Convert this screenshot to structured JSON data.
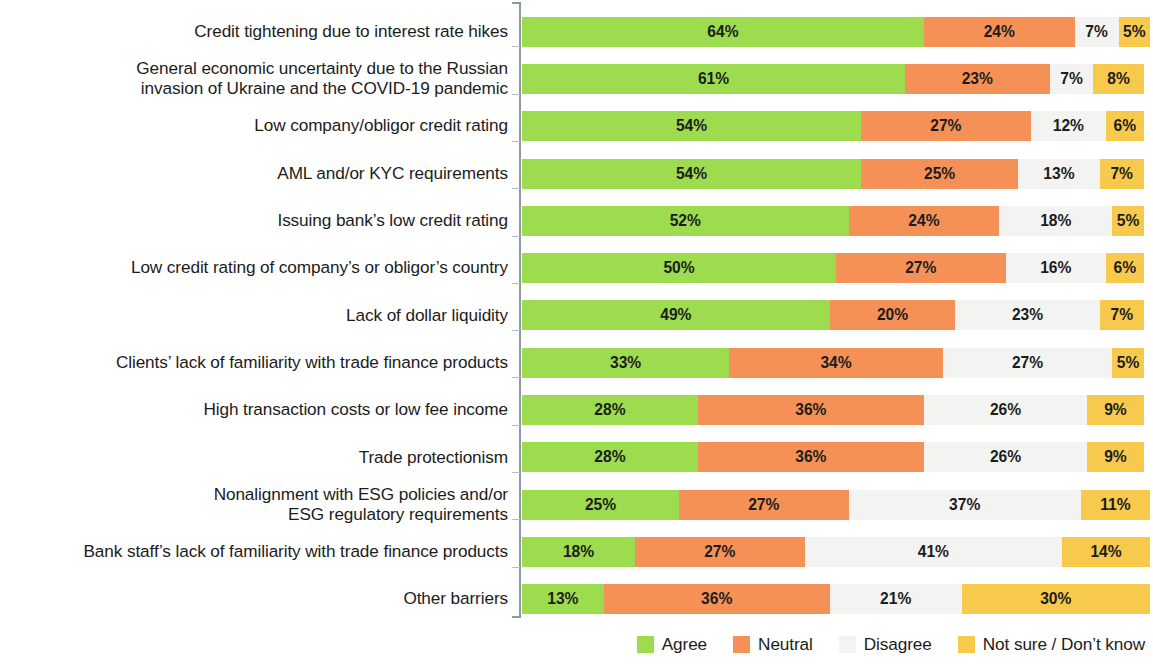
{
  "chart_data": {
    "type": "bar",
    "subtype": "stacked-horizontal-100percent",
    "title": "",
    "subtitle": "",
    "xlabel": "",
    "ylabel": "",
    "xlim": [
      0,
      100
    ],
    "grid": false,
    "legend_position": "bottom-right",
    "value_suffix": "%",
    "categories": [
      "Credit tightening due to interest rate hikes",
      "General economic uncertainty due to the Russian\ninvasion of Ukraine and the COVID-19 pandemic",
      "Low company/obligor credit rating",
      "AML and/or KYC requirements",
      "Issuing bank’s low credit rating",
      "Low credit rating of company’s or obligor’s country",
      "Lack of dollar liquidity",
      "Clients’ lack of familiarity with trade finance products",
      "High transaction costs or low fee income",
      "Trade protectionism",
      "Nonalignment with ESG policies and/or\nESG regulatory requirements",
      "Bank staff’s lack of familiarity with trade finance products",
      "Other barriers"
    ],
    "series": [
      {
        "name": "Agree",
        "color": "#9cdc4e",
        "values": [
          64,
          61,
          54,
          54,
          52,
          50,
          49,
          33,
          28,
          28,
          25,
          18,
          13
        ],
        "labels": [
          "64%",
          "61%",
          "54%",
          "54%",
          "52%",
          "50%",
          "49%",
          "33%",
          "28%",
          "28%",
          "25%",
          "18%",
          "13%"
        ]
      },
      {
        "name": "Neutral",
        "color": "#f59157",
        "values": [
          24,
          23,
          27,
          25,
          24,
          27,
          20,
          34,
          36,
          36,
          27,
          27,
          36
        ],
        "labels": [
          "24%",
          "23%",
          "27%",
          "25%",
          "24%",
          "27%",
          "20%",
          "34%",
          "36%",
          "36%",
          "27%",
          "27%",
          "36%"
        ]
      },
      {
        "name": "Disagree",
        "color": "#f3f3f2",
        "values": [
          7,
          7,
          12,
          13,
          18,
          16,
          23,
          27,
          26,
          26,
          37,
          41,
          21
        ],
        "labels": [
          "7%",
          "7%",
          "12%",
          "13%",
          "18%",
          "16%",
          "23%",
          "27%",
          "26%",
          "26%",
          "37%",
          "41%",
          "21%"
        ]
      },
      {
        "name": "Not sure / Don’t know",
        "color": "#f7c94c",
        "values": [
          5,
          8,
          6,
          7,
          5,
          6,
          7,
          5,
          9,
          9,
          11,
          14,
          30
        ],
        "labels": [
          "5%",
          "8%",
          "6%",
          "7%",
          "5%",
          "6%",
          "7%",
          "5%",
          "9%",
          "9%",
          "11%",
          "14%",
          "30%"
        ]
      }
    ]
  },
  "legend": {
    "items": [
      {
        "label": "Agree",
        "color": "#9cdc4e",
        "icon": "square-swatch-icon"
      },
      {
        "label": "Neutral",
        "color": "#f59157",
        "icon": "square-swatch-icon"
      },
      {
        "label": "Disagree",
        "color": "#f3f3f2",
        "icon": "square-swatch-icon"
      },
      {
        "label": "Not sure / Don’t know",
        "color": "#f7c94c",
        "icon": "square-swatch-icon"
      }
    ]
  }
}
